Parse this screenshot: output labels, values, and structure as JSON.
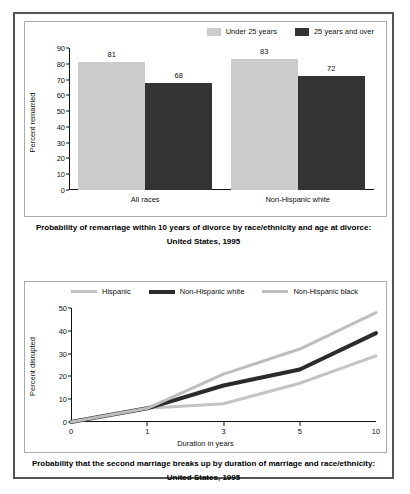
{
  "figure": {
    "top_caption_line1": "Probability of remarriage within 10 years of divorce by race/ethnicity and age at divorce:",
    "top_caption_line2": "United States, 1995",
    "bottom_caption_line1": "Probability that the second marriage breaks up by duration of marriage and race/ethnicity:",
    "bottom_caption_line2": "United States, 1995"
  },
  "colors": {
    "light_gray": "#cccccc",
    "dark_gray": "#333333",
    "mid_gray": "#b3b3b3",
    "axis": "#111111",
    "panel_border": "#555555",
    "chart_border": "#aaaaaa"
  },
  "chart_data": [
    {
      "type": "bar",
      "title": "Probability of remarriage within 10 years of divorce by race/ethnicity and age at divorce: United States, 1995",
      "xlabel": "",
      "ylabel": "Percent remarried",
      "ylim": [
        0,
        90
      ],
      "yticks": [
        0,
        10,
        20,
        30,
        40,
        50,
        60,
        70,
        80,
        90
      ],
      "ytick_labels": [
        "0",
        "10",
        "20",
        "30",
        "40",
        "50",
        "60",
        "70",
        "80",
        "90"
      ],
      "grid": false,
      "legend_position": "top-right",
      "categories": [
        "All races",
        "Non-Hispanic white"
      ],
      "series": [
        {
          "name": "Under 25 years",
          "color": "#cccccc",
          "values": [
            81,
            83
          ],
          "labels": [
            "81",
            "83"
          ]
        },
        {
          "name": "25 years and over",
          "color": "#333333",
          "values": [
            68,
            72
          ],
          "labels": [
            "68",
            "72"
          ]
        }
      ]
    },
    {
      "type": "line",
      "title": "Probability that the second marriage breaks up by duration of marriage and race/ethnicity: United States, 1995",
      "xlabel": "Duration in years",
      "ylabel": "Percent disrupted",
      "ylim": [
        0,
        50
      ],
      "yticks": [
        0,
        10,
        20,
        30,
        40,
        50
      ],
      "ytick_labels": [
        "0",
        "10",
        "20",
        "30",
        "40",
        "50"
      ],
      "x": [
        0,
        1,
        3,
        5,
        10
      ],
      "xtick_labels": [
        "0",
        "1",
        "3",
        "5",
        "10"
      ],
      "grid": false,
      "legend_position": "top-center",
      "series": [
        {
          "name": "Hispanic",
          "color": "#c4c4c4",
          "width": 3,
          "values": [
            0,
            6,
            8,
            17,
            29
          ]
        },
        {
          "name": "Non-Hispanic white",
          "color": "#2b2b2b",
          "width": 4,
          "values": [
            0,
            6,
            16,
            23,
            39
          ]
        },
        {
          "name": "Non-Hispanic black",
          "color": "#bdbdbd",
          "width": 3,
          "values": [
            0,
            6,
            21,
            32,
            48
          ]
        }
      ]
    }
  ]
}
